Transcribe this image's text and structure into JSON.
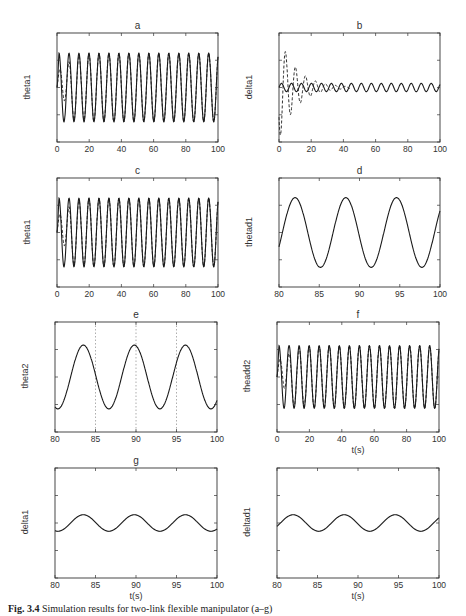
{
  "figure": {
    "caption_label": "Fig. 3.4",
    "caption_text": "Simulation results for two-link flexible manipulator (a–g)",
    "line_color": "#1a1a1a",
    "axis_color": "#333333",
    "grid_color": "#888888"
  },
  "chart_data": [
    {
      "id": "a",
      "type": "line",
      "title": "a",
      "xlabel": "",
      "ylabel": "theta1",
      "xlim": [
        0,
        100
      ],
      "ylim": [
        -1,
        1
      ],
      "xticks": [
        "0",
        "20",
        "40",
        "60",
        "80",
        "100"
      ],
      "yticks": [
        "1",
        "0.5",
        "0",
        "-0.5",
        "-1"
      ],
      "series": [
        {
          "name": "actual",
          "style": "solid",
          "description": "sinusoid amplitude ~0.63, period ~6 s, from t=0 to 100"
        },
        {
          "name": "desired/estimate",
          "style": "dashed",
          "description": "converges to solid within ~15 s"
        }
      ],
      "amplitude": 0.63,
      "period": 6.2
    },
    {
      "id": "b",
      "type": "line",
      "title": "b",
      "xlabel": "",
      "ylabel": "delta1",
      "xlim": [
        0,
        100
      ],
      "ylim": [
        -0.2,
        0.2
      ],
      "xticks": [
        "0",
        "20",
        "40",
        "60",
        "80",
        "100"
      ],
      "yticks": [
        "0.2",
        "0.1",
        "0",
        "-0.1",
        "-0.2"
      ],
      "series": [
        {
          "name": "with control",
          "style": "solid",
          "description": "small oscillation amplitude ~0.015"
        },
        {
          "name": "without control",
          "style": "dashed",
          "description": "decaying oscillation, peak ~0.19 at t≈4, ~-0.18 at t≈6, decays to ~0.02 by t=40"
        }
      ],
      "amplitude": 0.015,
      "peak_dashed": 0.19,
      "period": 6.2
    },
    {
      "id": "c",
      "type": "line",
      "title": "c",
      "xlabel": "",
      "ylabel": "theta1",
      "xlim": [
        0,
        100
      ],
      "ylim": [
        -1,
        1
      ],
      "xticks": [
        "0",
        "20",
        "40",
        "60",
        "80",
        "100"
      ],
      "yticks": [
        "1",
        "0.5",
        "0",
        "-0.5",
        "-1"
      ],
      "series": [
        {
          "name": "actual",
          "style": "solid"
        },
        {
          "name": "desired",
          "style": "dashed"
        }
      ],
      "amplitude": 0.63,
      "period": 6.2
    },
    {
      "id": "d",
      "type": "line",
      "title": "d",
      "xlabel": "",
      "ylabel": "thetad1",
      "xlim": [
        80,
        100
      ],
      "ylim": [
        -1,
        1
      ],
      "xticks": [
        "80",
        "85",
        "90",
        "95",
        "100"
      ],
      "yticks": [
        "1",
        "0.5",
        "0",
        "-0.5",
        "-1"
      ],
      "series": [
        {
          "name": "thetad1",
          "style": "solid"
        }
      ],
      "amplitude": 0.64,
      "period": 6.3,
      "peaks_t": [
        82.0,
        88.3,
        94.6
      ],
      "troughs_t": [
        85.2,
        91.5,
        97.8
      ]
    },
    {
      "id": "e",
      "type": "line",
      "title": "e",
      "xlabel": "",
      "ylabel": "theta2",
      "xlim": [
        80,
        100
      ],
      "ylim": [
        -1,
        1
      ],
      "xticks": [
        "80",
        "85",
        "90",
        "95",
        "100"
      ],
      "yticks": [
        "1",
        "0.5",
        "0",
        "-0.5",
        "-1"
      ],
      "vlines": [
        85,
        90,
        95
      ],
      "series": [
        {
          "name": "theta2",
          "style": "solid"
        }
      ],
      "amplitude": 0.58,
      "period": 6.3,
      "peaks_t": [
        83.5,
        89.8,
        96.1
      ],
      "troughs_t": [
        80.3,
        86.6,
        92.9,
        99.2
      ]
    },
    {
      "id": "f",
      "type": "line",
      "title": "f",
      "xlabel": "t(s)",
      "ylabel": "theadd2",
      "xlim": [
        0,
        100
      ],
      "ylim": [
        -1,
        1
      ],
      "xticks": [
        "0",
        "20",
        "40",
        "60",
        "80",
        "100"
      ],
      "yticks": [
        "1",
        "0.5",
        "0",
        "-0.5",
        "-1"
      ],
      "series": [
        {
          "name": "actual",
          "style": "solid"
        },
        {
          "name": "desired",
          "style": "dashed"
        }
      ],
      "amplitude": 0.57,
      "period": 6.2
    },
    {
      "id": "g",
      "type": "line",
      "title": "g",
      "xlabel": "t(s)",
      "ylabel": "delta1",
      "xlim": [
        80,
        100
      ],
      "ylim": [
        -0.1,
        0.1
      ],
      "xticks": [
        "80",
        "85",
        "90",
        "95",
        "100"
      ],
      "yticks": [
        "0.1",
        "0.05",
        "0",
        "-0.05",
        "-0.1"
      ],
      "series": [
        {
          "name": "delta1",
          "style": "solid"
        }
      ],
      "amplitude": 0.015,
      "period": 6.3,
      "peaks_t": [
        83.5,
        89.8,
        96.1
      ]
    },
    {
      "id": "h",
      "type": "line",
      "title": "",
      "xlabel": "t(s)",
      "ylabel": "deltad1",
      "xlim": [
        80,
        100
      ],
      "ylim": [
        -0.1,
        0.1
      ],
      "xticks": [
        "80",
        "85",
        "90",
        "95",
        "100"
      ],
      "yticks": [
        "0.1",
        "0.05",
        "0",
        "-0.05",
        "-0.1"
      ],
      "series": [
        {
          "name": "deltad1",
          "style": "solid"
        }
      ],
      "amplitude": 0.015,
      "period": 6.3,
      "peaks_t": [
        82.0,
        88.3,
        94.6
      ]
    }
  ]
}
